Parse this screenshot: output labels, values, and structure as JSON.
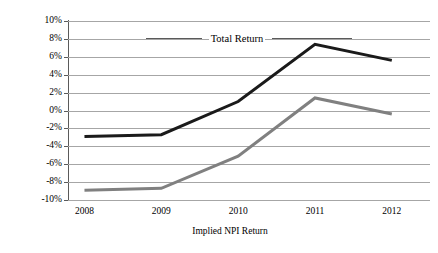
{
  "chart_data": {
    "type": "line",
    "title": "",
    "subtitle": "",
    "xlabel": "Implied NPI Return",
    "ylabel": "",
    "categories": [
      "2008",
      "2009",
      "2010",
      "2011",
      "2012"
    ],
    "ylim": [
      -10,
      10
    ],
    "ytick_step": 2,
    "ytick_labels": [
      "10%",
      "8%",
      "6%",
      "4%",
      "2%",
      "0%",
      "-2%",
      "-4%",
      "-6%",
      "-8%",
      "-10%"
    ],
    "ytick_values": [
      10,
      8,
      6,
      4,
      2,
      0,
      -2,
      -4,
      -6,
      -8,
      -10
    ],
    "grid": true,
    "legend_position": "inline-annotation",
    "annotations": [
      {
        "text": "Total Return",
        "value": 8,
        "style": "leader-lines"
      }
    ],
    "series": [
      {
        "name": "Total Return",
        "color": "#1a1a1a",
        "width": 3,
        "values": [
          -2.9,
          -2.7,
          1.0,
          7.4,
          5.6
        ]
      },
      {
        "name": "Implied NPI Return",
        "color": "#808080",
        "width": 3,
        "values": [
          -8.9,
          -8.7,
          -5.1,
          1.4,
          -0.4
        ]
      }
    ]
  },
  "axis": {
    "x_title": "Implied NPI Return",
    "annotation_label": "Total Return"
  },
  "colors": {
    "gridline": "#a6a6a6",
    "axis": "#5a5a5a",
    "background": "#ffffff",
    "series_total_return": "#1a1a1a",
    "series_implied_npi": "#808080"
  }
}
